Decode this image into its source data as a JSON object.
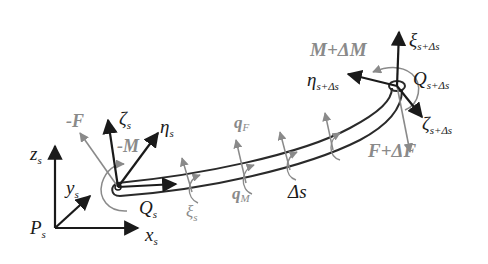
{
  "diagram": {
    "colors": {
      "frame_arrows": "#1a1a1a",
      "load_arrows": "#8a8a8a",
      "rod_outline": "#2a2a2a",
      "background": "#ffffff"
    },
    "global_frame": {
      "origin_label": "P",
      "origin_sub": "s",
      "axes": [
        {
          "label": "z",
          "sub": "s"
        },
        {
          "label": "y",
          "sub": "s"
        },
        {
          "label": "x",
          "sub": "s"
        }
      ]
    },
    "start_node": {
      "label": "Q",
      "sub": "s",
      "axes": [
        {
          "label": "ζ",
          "sub": "s"
        },
        {
          "label": "η",
          "sub": "s"
        },
        {
          "label": "ξ",
          "sub": "s"
        }
      ],
      "force_label": "-F",
      "moment_label": "-M"
    },
    "end_node": {
      "label": "Q",
      "sub": "s+Δs",
      "axes": [
        {
          "label": "ξ",
          "sub": "s+Δs"
        },
        {
          "label": "η",
          "sub": "s+Δs"
        },
        {
          "label": "ζ",
          "sub": "s+Δs"
        }
      ],
      "force_label": "F+ΔF",
      "moment_label": "M+ΔM"
    },
    "distributed_loads": {
      "force_label": "q",
      "force_sub": "F",
      "moment_label": "q",
      "moment_sub": "M"
    },
    "segment_label": "Δs"
  }
}
